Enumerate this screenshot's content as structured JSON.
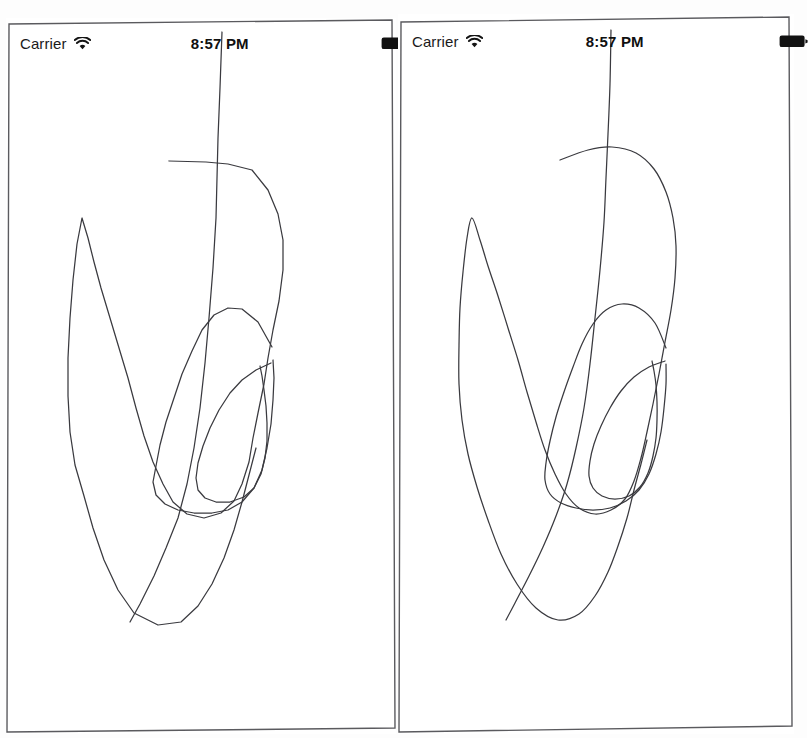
{
  "app": {
    "title": "Drawing Smoothing Comparison",
    "background_color": "#ffffff",
    "ink_color": "#3a3a3f",
    "frame_color": "#5a5a5e"
  },
  "panels": [
    {
      "id": "raw",
      "name": "raw-stroke-panel",
      "statusbar": {
        "carrier": "Carrier",
        "wifi_icon": "wifi-icon",
        "time": "8:57 PM",
        "battery_icon": "battery-icon",
        "battery_level": "full"
      },
      "canvas": {
        "render_mode": "polyline",
        "stroke_count": 4,
        "strokes": [
          {
            "name": "long-diagonal-stroke",
            "closed": false,
            "points": "216,14 214,70 212,120 211,160 210,200 207,250 203,300 199,345 194,390 188,430 181,466 172,500 160,530 148,558 134,586 124,604"
          },
          {
            "name": "outer-loop-stroke",
            "closed": false,
            "points": "163,143 200,144 222,146 246,152 262,172 272,196 277,222 277,252 273,283 267,312 262,340 258,366 252,395 247,420 243,444 236,466 228,483 215,495 198,500 181,496 167,484 157,466 147,444 138,418 130,390 122,360 113,330 104,300 95,270 88,244 82,220 76,200 71,226 67,262 64,300 62,340 62,378 64,414 69,447 78,478 87,510 98,542 112,572 128,595 152,607 175,604 192,588 206,566 218,540 228,512 236,484 243,457 250,430"
          },
          {
            "name": "middle-loop-stroke",
            "closed": false,
            "points": "266,329 252,304 236,291 222,290 208,297 196,312 186,333 176,356 168,380 160,404 154,427 150,448 147,464 150,477 159,486 172,492 188,495 206,495 222,492 236,484 248,470 256,452 261,430 265,406 267,382 268,360 267,342"
          },
          {
            "name": "inner-loop-stroke",
            "closed": false,
            "points": "265,345 250,352 236,362 224,375 213,392 204,410 197,428 192,445 190,460 192,472 199,480 210,484 224,484 238,479 248,470 255,456 259,440 261,423 261,405 260,388 258,372 256,358 254,348"
          }
        ]
      }
    },
    {
      "id": "smoothed",
      "name": "smoothed-stroke-panel",
      "statusbar": {
        "carrier": "Carrier",
        "wifi_icon": "wifi-icon",
        "time": "8:57 PM",
        "battery_icon": "battery-icon",
        "battery_level": "full"
      },
      "canvas": {
        "render_mode": "smoothed-spline",
        "stroke_count": 4,
        "strokes": [
          {
            "name": "long-diagonal-stroke",
            "closed": false,
            "points": "213,16 212,70 210,120 208,164 206,208 202,256 197,304 192,350 186,394 178,434 169,470 158,502 145,533 131,562 117,589 108,606"
          },
          {
            "name": "outer-loop-stroke",
            "closed": false,
            "points": "162,146 190,136 214,133 238,139 256,155 268,178 275,204 278,232 277,264 273,296 267,328 261,360 255,390 249,418 243,444 236,467 227,485 213,496 197,500 181,494 168,480 157,460 147,436 138,408 129,378 120,346 110,314 100,282 90,252 82,226 74,204 69,224 65,258 62,294 61,332 61,370 64,406 70,440 79,473 90,506 103,540 119,570 138,594 160,606 181,600 197,582 210,558 220,532 229,504 236,476 243,450 249,426"
          },
          {
            "name": "middle-loop-stroke",
            "closed": false,
            "points": "268,334 257,309 241,294 224,290 208,296 195,310 184,330 175,353 166,378 158,403 152,427 148,449 147,466 152,480 163,489 178,494 195,496 212,494 228,487 241,476 251,460 258,440 263,418 266,394 268,370 268,350"
          },
          {
            "name": "inner-loop-stroke",
            "closed": false,
            "points": "267,347 251,353 236,363 223,377 212,394 203,412 196,430 192,447 191,462 195,474 204,482 217,485 231,482 242,473 250,459 255,442 258,424 259,406 259,388 258,371 256,357 254,347"
          }
        ]
      }
    }
  ]
}
